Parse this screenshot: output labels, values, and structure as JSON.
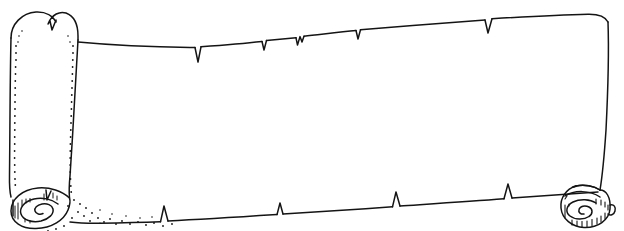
{
  "canvas": {
    "width": 624,
    "height": 231,
    "background_color": "#ffffff",
    "ink_color": "#141414"
  },
  "caption": {
    "text": "and write it on the tablet",
    "note": "clipped at top edge of image, only lower portion of glyphs visible",
    "color": "#1a1a1a"
  },
  "illustration": {
    "title": "Blank unrolled scroll / parchment banner",
    "style": "black-and-white pen line art",
    "parts": {
      "left_roll_panel": "vertical rolled left end with rounded top and small notch",
      "left_bottom_spiral": "spiral scroll curl at bottom left with stipple shading",
      "right_bottom_spiral": "spiral scroll curl at bottom right with hatch lines",
      "top_edge": "upward-sloping torn edge with V notches",
      "bottom_edge": "upward-sloping torn edge with spike notches",
      "right_edge": "slightly curved vertical right border",
      "writing_area": "large blank parchment face"
    },
    "shading": {
      "stipple_dots": "dotted shading along left fold lines and beneath bottom-left curl",
      "hatching": "parallel short strokes inside bottom-right curl"
    }
  }
}
